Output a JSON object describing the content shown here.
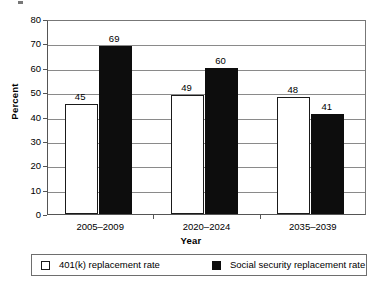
{
  "chart_data": {
    "type": "bar",
    "title": "",
    "xlabel": "Year",
    "ylabel": "Percent",
    "categories": [
      "2005–2009",
      "2020–2024",
      "2035–2039"
    ],
    "series": [
      {
        "name": "401(k) replacement rate",
        "color": "#ffffff",
        "values": [
          45,
          49,
          48
        ]
      },
      {
        "name": "Social security replacement rate",
        "color": "#0d0d0d",
        "values": [
          69,
          60,
          41
        ]
      }
    ],
    "ylim": [
      0,
      80
    ],
    "ytick_step": 10,
    "yticks": [
      0,
      10,
      20,
      30,
      40,
      50,
      60,
      70,
      80
    ],
    "ytick_labels": [
      "0",
      "10",
      "20",
      "30",
      "40",
      "50",
      "60",
      "70",
      "80"
    ],
    "grid": "horizontal",
    "legend_position": "bottom",
    "data_labels": true
  },
  "axes": {
    "y_title": "Percent",
    "x_title": "Year"
  },
  "legend": {
    "items": [
      {
        "label": "401(k) replacement rate",
        "swatch": "light"
      },
      {
        "label": "Social security replacement rate",
        "swatch": "dark"
      }
    ]
  }
}
